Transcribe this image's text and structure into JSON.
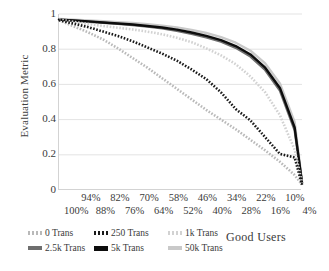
{
  "chart_data": {
    "type": "line",
    "title": "",
    "xlabel": "Good Users",
    "ylabel": "Evaluation Metric",
    "ylim": [
      0,
      1
    ],
    "y_ticks": [
      "0",
      "0.2",
      "0.4",
      "0.6",
      "0.8",
      "1"
    ],
    "grid": "horizontal",
    "legend_position": "bottom-left",
    "x_tick_labels_top": [
      "94%",
      "82%",
      "70%",
      "58%",
      "46%",
      "34%",
      "22%",
      "10%"
    ],
    "x_tick_labels_bottom": [
      "100%",
      "88%",
      "76%",
      "64%",
      "52%",
      "40%",
      "28%",
      "16%",
      "4%"
    ],
    "x": [
      100,
      94,
      88,
      82,
      76,
      70,
      64,
      58,
      52,
      46,
      40,
      34,
      28,
      22,
      16,
      10,
      4,
      1
    ],
    "series": [
      {
        "name": "0 Trans",
        "style": "dotted",
        "color": "#b9b9b9",
        "values": [
          0.965,
          0.93,
          0.895,
          0.855,
          0.805,
          0.75,
          0.695,
          0.635,
          0.575,
          0.515,
          0.455,
          0.4,
          0.345,
          0.285,
          0.225,
          0.16,
          0.085,
          0.03
        ]
      },
      {
        "name": "250 Trans",
        "style": "dotted",
        "color": "#1a1a1a",
        "values": [
          0.965,
          0.945,
          0.925,
          0.9,
          0.875,
          0.845,
          0.81,
          0.775,
          0.735,
          0.685,
          0.63,
          0.555,
          0.46,
          0.395,
          0.3,
          0.205,
          0.185,
          0.03
        ]
      },
      {
        "name": "1k Trans",
        "style": "dotted",
        "color": "#d2d2d2",
        "values": [
          0.968,
          0.955,
          0.943,
          0.932,
          0.922,
          0.912,
          0.9,
          0.885,
          0.865,
          0.84,
          0.805,
          0.765,
          0.715,
          0.645,
          0.555,
          0.425,
          0.23,
          0.04
        ]
      },
      {
        "name": "2.5k Trans",
        "style": "solid",
        "color": "#6e6e6e",
        "values": [
          0.968,
          0.962,
          0.956,
          0.95,
          0.944,
          0.937,
          0.928,
          0.918,
          0.905,
          0.888,
          0.868,
          0.843,
          0.808,
          0.758,
          0.682,
          0.565,
          0.34,
          0.04
        ]
      },
      {
        "name": "5k Trans",
        "style": "solid",
        "color": "#0d0d0d",
        "values": [
          0.968,
          0.963,
          0.958,
          0.952,
          0.946,
          0.94,
          0.932,
          0.923,
          0.911,
          0.895,
          0.876,
          0.852,
          0.818,
          0.77,
          0.695,
          0.58,
          0.355,
          0.04
        ]
      },
      {
        "name": "50k Trans",
        "style": "solid",
        "color": "#c9c9c9",
        "values": [
          0.972,
          0.968,
          0.964,
          0.959,
          0.954,
          0.949,
          0.942,
          0.934,
          0.923,
          0.909,
          0.892,
          0.869,
          0.837,
          0.791,
          0.719,
          0.606,
          0.385,
          0.05
        ]
      }
    ]
  },
  "legend": {
    "items": [
      {
        "label": "0 Trans",
        "marker": "dotted-light-marker"
      },
      {
        "label": "250 Trans",
        "marker": "dotted-dark-marker"
      },
      {
        "label": "1k Trans",
        "marker": "dotted-lighter-marker"
      },
      {
        "label": "2.5k Trans",
        "marker": "solid-gray-marker"
      },
      {
        "label": "5k Trans",
        "marker": "solid-black-marker"
      },
      {
        "label": "50k Trans",
        "marker": "solid-lightgray-marker"
      }
    ]
  }
}
